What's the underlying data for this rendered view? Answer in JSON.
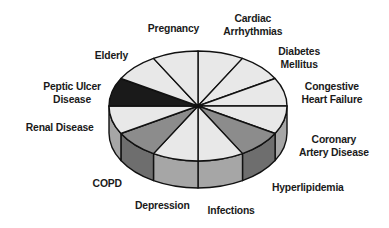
{
  "chart_data": {
    "type": "pie",
    "style": "3d",
    "title": "",
    "slices": [
      {
        "label": "Cardiac Arrhythmias",
        "value": 8.33,
        "top_color": "#e8e8e8",
        "side_color": "#a6a6a6"
      },
      {
        "label": "Diabetes Mellitus",
        "value": 8.33,
        "top_color": "#e8e8e8",
        "side_color": "#a6a6a6"
      },
      {
        "label": "Congestive Heart Failure",
        "value": 8.33,
        "top_color": "#e8e8e8",
        "side_color": "#a6a6a6"
      },
      {
        "label": "Coronary Artery Disease",
        "value": 8.33,
        "top_color": "#e8e8e8",
        "side_color": "#a6a6a6"
      },
      {
        "label": "Hyperlipidemia",
        "value": 8.33,
        "top_color": "#8c8c8c",
        "side_color": "#6e6e6e"
      },
      {
        "label": "Infections",
        "value": 8.33,
        "top_color": "#e8e8e8",
        "side_color": "#a6a6a6"
      },
      {
        "label": "Depression",
        "value": 8.33,
        "top_color": "#e8e8e8",
        "side_color": "#a6a6a6"
      },
      {
        "label": "COPD",
        "value": 8.33,
        "top_color": "#8c8c8c",
        "side_color": "#6e6e6e"
      },
      {
        "label": "Renal Disease",
        "value": 8.33,
        "top_color": "#e8e8e8",
        "side_color": "#a6a6a6"
      },
      {
        "label": "Peptic Ulcer Disease",
        "value": 8.33,
        "top_color": "#1a1a1a",
        "side_color": "#1a1a1a"
      },
      {
        "label": "Elderly",
        "value": 8.33,
        "top_color": "#e8e8e8",
        "side_color": "#a6a6a6"
      },
      {
        "label": "Pregnancy",
        "value": 8.33,
        "top_color": "#e8e8e8",
        "side_color": "#a6a6a6"
      }
    ],
    "legend": "none (labels placed around pie)"
  },
  "labels": {
    "cardiac": [
      "Cardiac",
      "Arrhythmias"
    ],
    "diabetes": [
      "Diabetes",
      "Mellitus"
    ],
    "chf": [
      "Congestive",
      "Heart Failure"
    ],
    "cad": [
      "Coronary",
      "Artery Disease"
    ],
    "hyperlipidemia": "Hyperlipidemia",
    "infections": "Infections",
    "depression": "Depression",
    "copd": "COPD",
    "renal": "Renal Disease",
    "peptic": [
      "Peptic Ulcer",
      "Disease"
    ],
    "elderly": "Elderly",
    "pregnancy": "Pregnancy"
  }
}
